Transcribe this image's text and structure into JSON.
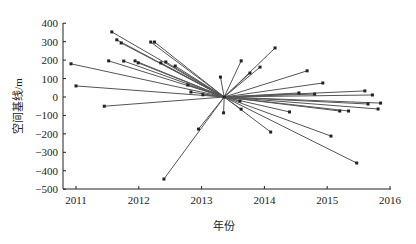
{
  "chart_data": {
    "type": "line",
    "subtype": "baseline-network (star)",
    "title": "",
    "xlabel": "年份",
    "ylabel": "空间基线/m",
    "xlim": [
      2010.95,
      2016
    ],
    "ylim": [
      -500,
      400
    ],
    "xticks": [
      "2011",
      "2012",
      "2013",
      "2014",
      "2015",
      "2016"
    ],
    "yticks": [
      "400",
      "300",
      "200",
      "100",
      "0",
      "-100",
      "-200",
      "-300",
      "-400",
      "-500"
    ],
    "grid": false,
    "legend": null,
    "master": {
      "x": 2013.36,
      "y": 0
    },
    "slaves": [
      {
        "x": 2010.92,
        "y": 180
      },
      {
        "x": 2011.0,
        "y": 60
      },
      {
        "x": 2011.45,
        "y": -50
      },
      {
        "x": 2011.57,
        "y": 353
      },
      {
        "x": 2011.65,
        "y": 310
      },
      {
        "x": 2011.72,
        "y": 293
      },
      {
        "x": 2011.52,
        "y": 196
      },
      {
        "x": 2011.76,
        "y": 195
      },
      {
        "x": 2011.94,
        "y": 196
      },
      {
        "x": 2011.99,
        "y": 185
      },
      {
        "x": 2012.19,
        "y": 298
      },
      {
        "x": 2012.25,
        "y": 298
      },
      {
        "x": 2012.35,
        "y": 185
      },
      {
        "x": 2012.43,
        "y": 190
      },
      {
        "x": 2012.58,
        "y": 168
      },
      {
        "x": 2012.78,
        "y": 65
      },
      {
        "x": 2012.83,
        "y": 27
      },
      {
        "x": 2013.02,
        "y": 12
      },
      {
        "x": 2013.3,
        "y": 108
      },
      {
        "x": 2013.35,
        "y": -86
      },
      {
        "x": 2012.4,
        "y": -445
      },
      {
        "x": 2012.95,
        "y": -174
      },
      {
        "x": 2013.63,
        "y": 196
      },
      {
        "x": 2013.77,
        "y": 130
      },
      {
        "x": 2013.93,
        "y": 162
      },
      {
        "x": 2014.17,
        "y": 266
      },
      {
        "x": 2014.68,
        "y": 142
      },
      {
        "x": 2014.93,
        "y": 76
      },
      {
        "x": 2015.6,
        "y": 33
      },
      {
        "x": 2015.72,
        "y": 11
      },
      {
        "x": 2014.55,
        "y": 22
      },
      {
        "x": 2014.8,
        "y": 16
      },
      {
        "x": 2015.65,
        "y": -38
      },
      {
        "x": 2015.85,
        "y": -33
      },
      {
        "x": 2015.81,
        "y": -65
      },
      {
        "x": 2015.2,
        "y": -76
      },
      {
        "x": 2015.34,
        "y": -76
      },
      {
        "x": 2014.4,
        "y": -81
      },
      {
        "x": 2013.63,
        "y": -66
      },
      {
        "x": 2013.61,
        "y": -22
      },
      {
        "x": 2014.1,
        "y": -190
      },
      {
        "x": 2015.06,
        "y": -212
      },
      {
        "x": 2015.47,
        "y": -358
      }
    ]
  }
}
